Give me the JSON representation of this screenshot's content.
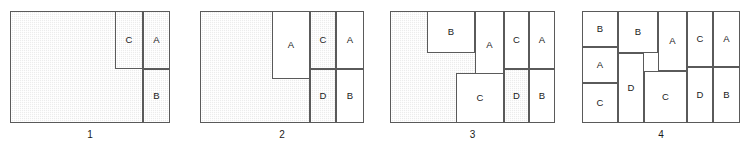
{
  "figure": {
    "type": "packing-stages-diagram",
    "piece_labels": [
      "A",
      "B",
      "C",
      "D"
    ],
    "colors": {
      "sheet_border": "#3a3a3a",
      "cell_border": "#5a5a5a",
      "shaded_fill": "#ececec",
      "white_fill": "#ffffff",
      "text": "#1a1a1a"
    },
    "panels": [
      {
        "caption": "1",
        "cells": [
          {
            "label": "",
            "shaded": true,
            "x": 0,
            "y": 0,
            "w": 133,
            "h": 112
          },
          {
            "label": "C",
            "shaded": true,
            "x": 105,
            "y": 0,
            "w": 28,
            "h": 58
          },
          {
            "label": "A",
            "shaded": true,
            "x": 133,
            "y": 0,
            "w": 27,
            "h": 58
          },
          {
            "label": "B",
            "shaded": true,
            "x": 133,
            "y": 58,
            "w": 27,
            "h": 54
          }
        ]
      },
      {
        "caption": "2",
        "cells": [
          {
            "label": "",
            "shaded": true,
            "x": 0,
            "y": 0,
            "w": 110,
            "h": 112
          },
          {
            "label": "A",
            "shaded": false,
            "x": 72,
            "y": 0,
            "w": 38,
            "h": 68
          },
          {
            "label": "C",
            "shaded": true,
            "x": 110,
            "y": 0,
            "w": 26,
            "h": 58
          },
          {
            "label": "A",
            "shaded": false,
            "x": 136,
            "y": 0,
            "w": 28,
            "h": 58
          },
          {
            "label": "D",
            "shaded": true,
            "x": 110,
            "y": 58,
            "w": 26,
            "h": 54
          },
          {
            "label": "B",
            "shaded": false,
            "x": 136,
            "y": 58,
            "w": 28,
            "h": 54
          }
        ]
      },
      {
        "caption": "3",
        "cells": [
          {
            "label": "",
            "shaded": true,
            "x": 0,
            "y": 0,
            "w": 104,
            "h": 112
          },
          {
            "label": "B",
            "shaded": false,
            "x": 37,
            "y": 0,
            "w": 48,
            "h": 42
          },
          {
            "label": "A",
            "shaded": false,
            "x": 85,
            "y": 0,
            "w": 29,
            "h": 68
          },
          {
            "label": "C",
            "shaded": false,
            "x": 66,
            "y": 62,
            "w": 48,
            "h": 50
          },
          {
            "label": "C",
            "shaded": false,
            "x": 114,
            "y": 0,
            "w": 25,
            "h": 58
          },
          {
            "label": "A",
            "shaded": false,
            "x": 139,
            "y": 0,
            "w": 26,
            "h": 58
          },
          {
            "label": "D",
            "shaded": true,
            "x": 114,
            "y": 58,
            "w": 25,
            "h": 54
          },
          {
            "label": "B",
            "shaded": false,
            "x": 139,
            "y": 58,
            "w": 26,
            "h": 54
          }
        ]
      },
      {
        "caption": "4",
        "cells": [
          {
            "label": "B",
            "shaded": false,
            "x": 0,
            "y": 0,
            "w": 36,
            "h": 36
          },
          {
            "label": "A",
            "shaded": false,
            "x": 0,
            "y": 36,
            "w": 36,
            "h": 36
          },
          {
            "label": "C",
            "shaded": false,
            "x": 0,
            "y": 72,
            "w": 36,
            "h": 40
          },
          {
            "label": "B",
            "shaded": false,
            "x": 36,
            "y": 0,
            "w": 40,
            "h": 42
          },
          {
            "label": "D",
            "shaded": false,
            "x": 36,
            "y": 42,
            "w": 26,
            "h": 70
          },
          {
            "label": "A",
            "shaded": false,
            "x": 76,
            "y": 0,
            "w": 29,
            "h": 60
          },
          {
            "label": "C",
            "shaded": false,
            "x": 62,
            "y": 60,
            "w": 43,
            "h": 52
          },
          {
            "label": "C",
            "shaded": false,
            "x": 105,
            "y": 0,
            "w": 26,
            "h": 56
          },
          {
            "label": "A",
            "shaded": false,
            "x": 131,
            "y": 0,
            "w": 27,
            "h": 56
          },
          {
            "label": "D",
            "shaded": false,
            "x": 105,
            "y": 56,
            "w": 26,
            "h": 56
          },
          {
            "label": "B",
            "shaded": false,
            "x": 131,
            "y": 56,
            "w": 27,
            "h": 56
          }
        ]
      }
    ],
    "panel_frames": [
      {
        "left": 10,
        "top": 11,
        "width": 160,
        "height": 112
      },
      {
        "left": 200,
        "top": 11,
        "width": 164,
        "height": 112
      },
      {
        "left": 390,
        "top": 11,
        "width": 165,
        "height": 112
      },
      {
        "left": 582,
        "top": 11,
        "width": 158,
        "height": 112
      }
    ]
  }
}
